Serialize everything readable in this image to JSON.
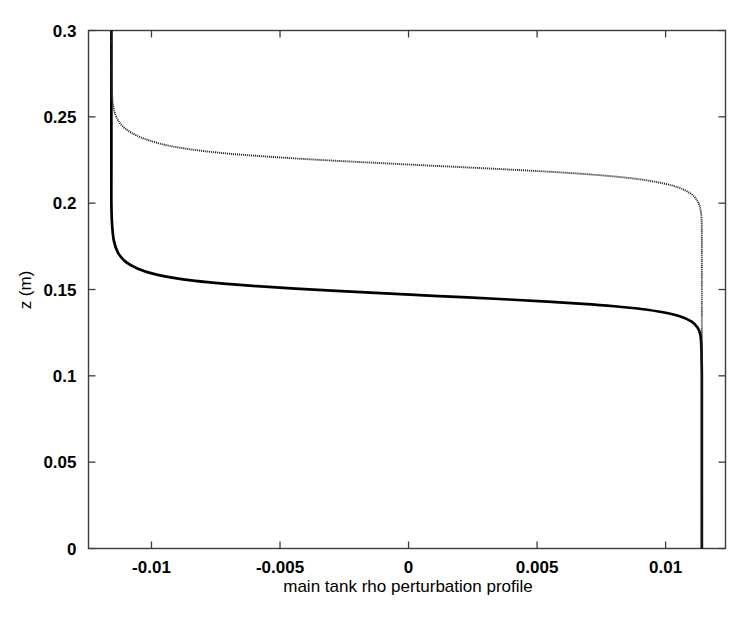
{
  "figure": {
    "background_color": "#ffffff",
    "frame_color": "#000000",
    "ylabel": "z (m)",
    "xlabel": "main tank rho perturbation profile"
  },
  "chart_data": {
    "type": "line",
    "title": "",
    "subtitle": "",
    "xlabel": "main tank rho perturbation profile",
    "ylabel": "z (m)",
    "xlim": [
      -0.01245,
      0.01233
    ],
    "ylim": [
      0,
      0.3
    ],
    "xticks": [
      -0.01,
      -0.005,
      0,
      0.005,
      0.01
    ],
    "xtick_labels": [
      "-0.01",
      "-0.005",
      "0",
      "0.005",
      "0.01"
    ],
    "yticks": [
      0,
      0.05,
      0.1,
      0.15,
      0.2,
      0.25,
      0.3
    ],
    "ytick_labels": [
      "0",
      "0.05",
      "0.1",
      "0.15",
      "0.2",
      "0.25",
      "0.3"
    ],
    "grid": false,
    "legend": null,
    "legend_position": "none",
    "annotations": [],
    "series": [
      {
        "name": "lower interface profile",
        "style": "solid-thick",
        "color": "#000000",
        "interface_z": 0.145,
        "x_lower_asymptote": 0.01141,
        "x_upper_asymptote": -0.01156,
        "points": [
          {
            "x": 0.01141,
            "y": 0.0
          },
          {
            "x": 0.01141,
            "y": 0.02
          },
          {
            "x": 0.01141,
            "y": 0.04
          },
          {
            "x": 0.01141,
            "y": 0.06
          },
          {
            "x": 0.01141,
            "y": 0.08
          },
          {
            "x": 0.01141,
            "y": 0.1
          },
          {
            "x": 0.0114,
            "y": 0.11
          },
          {
            "x": 0.01139,
            "y": 0.118
          },
          {
            "x": 0.01135,
            "y": 0.124
          },
          {
            "x": 0.01124,
            "y": 0.128
          },
          {
            "x": 0.011,
            "y": 0.1315
          },
          {
            "x": 0.01055,
            "y": 0.1345
          },
          {
            "x": 0.0099,
            "y": 0.1368
          },
          {
            "x": 0.00905,
            "y": 0.1387
          },
          {
            "x": 0.008,
            "y": 0.1403
          },
          {
            "x": 0.0068,
            "y": 0.1417
          },
          {
            "x": 0.0054,
            "y": 0.143
          },
          {
            "x": 0.0039,
            "y": 0.1442
          },
          {
            "x": 0.0023,
            "y": 0.1454
          },
          {
            "x": 0.0006,
            "y": 0.1466
          },
          {
            "x": -0.0011,
            "y": 0.1479
          },
          {
            "x": -0.0028,
            "y": 0.1492
          },
          {
            "x": -0.0044,
            "y": 0.1505
          },
          {
            "x": -0.0059,
            "y": 0.1519
          },
          {
            "x": -0.0072,
            "y": 0.1534
          },
          {
            "x": -0.0083,
            "y": 0.155
          },
          {
            "x": -0.0092,
            "y": 0.1569
          },
          {
            "x": -0.00995,
            "y": 0.1592
          },
          {
            "x": -0.01055,
            "y": 0.1622
          },
          {
            "x": -0.011,
            "y": 0.166
          },
          {
            "x": -0.0113,
            "y": 0.1712
          },
          {
            "x": -0.01146,
            "y": 0.178
          },
          {
            "x": -0.01153,
            "y": 0.187
          },
          {
            "x": -0.01156,
            "y": 0.2
          },
          {
            "x": -0.01156,
            "y": 0.22
          },
          {
            "x": -0.01156,
            "y": 0.25
          },
          {
            "x": -0.01156,
            "y": 0.28
          },
          {
            "x": -0.01156,
            "y": 0.3
          }
        ]
      },
      {
        "name": "upper interface profile",
        "style": "dotted-thin",
        "color": "#2b2b2b",
        "interface_z": 0.222,
        "x_lower_asymptote": 0.01141,
        "x_upper_asymptote": -0.01156,
        "points": [
          {
            "x": 0.01141,
            "y": 0.0
          },
          {
            "x": 0.01141,
            "y": 0.04
          },
          {
            "x": 0.01141,
            "y": 0.08
          },
          {
            "x": 0.01141,
            "y": 0.12
          },
          {
            "x": 0.01141,
            "y": 0.16
          },
          {
            "x": 0.01141,
            "y": 0.18
          },
          {
            "x": 0.0114,
            "y": 0.19
          },
          {
            "x": 0.01136,
            "y": 0.196
          },
          {
            "x": 0.01125,
            "y": 0.201
          },
          {
            "x": 0.011,
            "y": 0.2053
          },
          {
            "x": 0.01055,
            "y": 0.2088
          },
          {
            "x": 0.0099,
            "y": 0.2115
          },
          {
            "x": 0.009,
            "y": 0.2138
          },
          {
            "x": 0.0079,
            "y": 0.2156
          },
          {
            "x": 0.00665,
            "y": 0.2171
          },
          {
            "x": 0.00525,
            "y": 0.2184
          },
          {
            "x": 0.00375,
            "y": 0.2196
          },
          {
            "x": 0.00215,
            "y": 0.2208
          },
          {
            "x": 0.0005,
            "y": 0.222
          },
          {
            "x": -0.0012,
            "y": 0.2233
          },
          {
            "x": -0.0029,
            "y": 0.2246
          },
          {
            "x": -0.0045,
            "y": 0.226
          },
          {
            "x": -0.006,
            "y": 0.2275
          },
          {
            "x": -0.0073,
            "y": 0.2291
          },
          {
            "x": -0.0084,
            "y": 0.231
          },
          {
            "x": -0.0093,
            "y": 0.2332
          },
          {
            "x": -0.01,
            "y": 0.2359
          },
          {
            "x": -0.01058,
            "y": 0.2392
          },
          {
            "x": -0.01102,
            "y": 0.2432
          },
          {
            "x": -0.01131,
            "y": 0.2482
          },
          {
            "x": -0.01147,
            "y": 0.2548
          },
          {
            "x": -0.01154,
            "y": 0.264
          },
          {
            "x": -0.01156,
            "y": 0.275
          },
          {
            "x": -0.01156,
            "y": 0.29
          },
          {
            "x": -0.01156,
            "y": 0.3
          }
        ]
      }
    ]
  }
}
